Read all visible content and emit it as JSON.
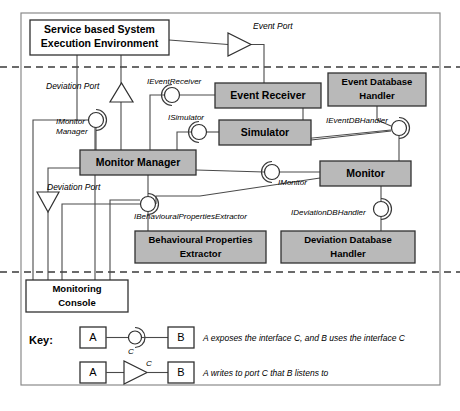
{
  "diagram": {
    "layers": [
      {
        "name": "execution-layer",
        "y": 67
      },
      {
        "name": "monitoring-layer",
        "y": 272
      },
      {
        "name": "console-layer",
        "y": 385
      }
    ],
    "nodes": [
      {
        "id": "service_env",
        "label_line1": "Service based System",
        "label_line2": "Execution Environment",
        "fill": "white",
        "x": 30,
        "y": 20,
        "w": 139,
        "h": 35
      },
      {
        "id": "event_receiver",
        "label_line1": "Event Receiver",
        "label_line2": "",
        "fill": "gray",
        "x": 215,
        "y": 83,
        "w": 106,
        "h": 25
      },
      {
        "id": "event_db_handler",
        "label_line1": "Event Database",
        "label_line2": "Handler",
        "fill": "gray",
        "x": 328,
        "y": 73,
        "w": 98,
        "h": 33
      },
      {
        "id": "simulator",
        "label_line1": "Simulator",
        "label_line2": "",
        "fill": "gray",
        "x": 219,
        "y": 120,
        "w": 92,
        "h": 25
      },
      {
        "id": "monitor_manager",
        "label_line1": "Monitor Manager",
        "label_line2": "",
        "fill": "gray",
        "x": 80,
        "y": 150,
        "w": 116,
        "h": 25
      },
      {
        "id": "monitor",
        "label_line1": "Monitor",
        "label_line2": "",
        "fill": "gray",
        "x": 320,
        "y": 161,
        "w": 91,
        "h": 25
      },
      {
        "id": "behavioural_properties_extractor",
        "label_line1": "Behavioural Properties",
        "label_line2": "Extractor",
        "fill": "gray",
        "x": 135,
        "y": 231,
        "w": 131,
        "h": 32
      },
      {
        "id": "deviation_database_handler",
        "label_line1": "Deviation Database",
        "label_line2": "Handler",
        "fill": "gray",
        "x": 281,
        "y": 231,
        "w": 134,
        "h": 32
      },
      {
        "id": "monitoring_console",
        "label_line1": "Monitoring",
        "label_line2": "Console",
        "fill": "white",
        "x": 26,
        "y": 280,
        "w": 102,
        "h": 32
      }
    ],
    "interfaces": [
      {
        "id": "i_event_receiver",
        "label": "IEventReceiver",
        "cx": 172,
        "cy": 95,
        "label_x": 147,
        "label_y": 84,
        "anchor": "start"
      },
      {
        "id": "i_simulator",
        "label": "ISimulator",
        "cx": 199,
        "cy": 132,
        "label_x": 168,
        "label_y": 120,
        "anchor": "start"
      },
      {
        "id": "i_monitor_manager",
        "label_line1": "IMonitor",
        "label_line2": "Manager",
        "cx": 96,
        "cy": 120,
        "label_x": 56,
        "label_y": 124,
        "anchor": "start"
      },
      {
        "id": "i_event_db_handler",
        "label": "IEventDBHandler",
        "cx": 399,
        "cy": 128,
        "label_x": 330,
        "label_y": 123,
        "anchor": "start"
      },
      {
        "id": "i_monitor",
        "label": "IMonitor",
        "cx": 272,
        "cy": 172,
        "label_x": 278,
        "label_y": 185,
        "anchor": "start"
      },
      {
        "id": "i_behavioural_properties_extractor",
        "label": "IBehaviouralPropertiesExtractor",
        "cx": 148,
        "cy": 204,
        "label_x": 134,
        "label_y": 218,
        "anchor": "start"
      },
      {
        "id": "i_deviation_db_handler",
        "label": "IDeviationDBHandler",
        "cx": 381,
        "cy": 209,
        "label_x": 291,
        "label_y": 214,
        "anchor": "start"
      }
    ],
    "ports": [
      {
        "id": "event_port",
        "label": "Event Port",
        "label_x": 253,
        "label_y": 28,
        "direction": "right",
        "x": 228,
        "y": 35,
        "size": 21
      },
      {
        "id": "deviation_port_upper",
        "label": "Deviation Port",
        "label_x": 58,
        "label_y": 86,
        "direction": "up",
        "x": 110,
        "y": 84,
        "size": 22
      },
      {
        "id": "deviation_port_lower",
        "label": "Deviation Port",
        "label_x": 48,
        "label_y": 190,
        "direction": "down",
        "x": 37,
        "y": 192,
        "size": 22
      }
    ],
    "key": {
      "title": "Key:",
      "title_x": 29,
      "title_y": 340,
      "rows": [
        {
          "id": "key-interface-row",
          "box_a": "A",
          "box_b": "B",
          "connector_label": "C",
          "description": "A exposes the interface C, and B uses the interface C",
          "type": "interface"
        },
        {
          "id": "key-port-row",
          "box_a": "A",
          "box_b": "B",
          "connector_label": "C",
          "description": "A writes to port C that B listens to",
          "type": "port"
        }
      ]
    },
    "colors": {
      "gray_fill": "#b9b9b9",
      "white_fill": "#ffffff",
      "stroke": "#303030",
      "connector": "#4a4a4a",
      "frame": "#8a8a8a"
    }
  }
}
